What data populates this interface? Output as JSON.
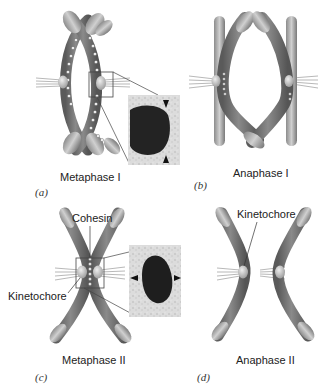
{
  "figure": {
    "panels": [
      {
        "id": "a",
        "letter": "(a)",
        "stage": "Metaphase I"
      },
      {
        "id": "b",
        "letter": "(b)",
        "stage": "Anaphase I"
      },
      {
        "id": "c",
        "letter": "(c)",
        "stage": "Metaphase II"
      },
      {
        "id": "d",
        "letter": "(d)",
        "stage": "Anaphase II"
      }
    ],
    "callouts": {
      "cohesin": "Cohesin",
      "kinetochore_c": "Kinetochore",
      "kinetochore_d": "Kinetochore"
    },
    "colors": {
      "chromatid_dark": "#6e6e6e",
      "chromatid_light": "#a9a9a9",
      "kinetochore": "#c8c8c8",
      "cohesin_bead": "#f2f2f2",
      "micrograph_bg": "#d8d8d8",
      "micrograph_blob": "#1e1e1e"
    }
  }
}
